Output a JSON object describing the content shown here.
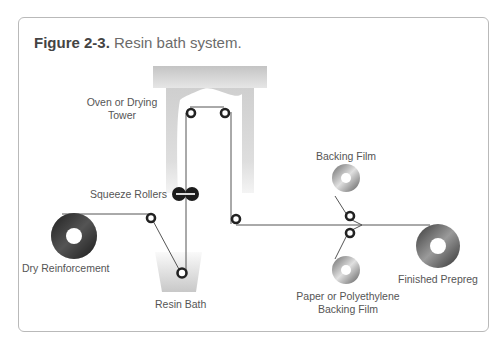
{
  "figure": {
    "number": "Figure 2-3.",
    "caption": "Resin bath system."
  },
  "labels": {
    "oven_line1": "Oven or Drying",
    "oven_line2": "Tower",
    "squeeze_rollers": "Squeeze Rollers",
    "dry_reinforcement": "Dry Reinforcement",
    "resin_bath": "Resin Bath",
    "backing_film": "Backing Film",
    "paper_backing_line1": "Paper or Polyethylene",
    "paper_backing_line2": "Backing Film",
    "finished_prepreg": "Finished Prepreg"
  },
  "colors": {
    "frame_border": "#b9b9b9",
    "oven_gray": "#d2d2d2",
    "line": "#555555",
    "roller": "#222222"
  }
}
